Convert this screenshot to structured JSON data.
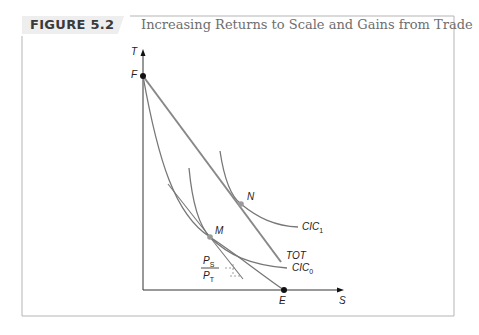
{
  "figure": {
    "label": "FIGURE 5.2",
    "title": "Increasing Returns to Scale and Gains from Trade"
  },
  "axes": {
    "y_label": "T",
    "x_label": "S"
  },
  "points": {
    "F": "F",
    "E": "E",
    "M": "M",
    "N": "N"
  },
  "curves": {
    "cic1": "CIC",
    "cic1_sub": "1",
    "cic0": "CIC",
    "cic0_sub": "0",
    "tot": "TOT",
    "price_num": "P",
    "price_num_sub": "S",
    "price_den": "P",
    "price_den_sub": "T"
  },
  "colors": {
    "curve": "#777777",
    "tot": "#888888",
    "point_gray": "#999999",
    "point_black": "#111111",
    "frame": "#b5b5b5",
    "tab": "#eeeeee"
  }
}
